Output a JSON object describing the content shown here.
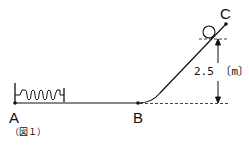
{
  "figure": {
    "caption": "（図１）",
    "points": {
      "A": "A",
      "B": "B",
      "C": "C"
    },
    "height_label": "2.5 〔m〕",
    "colors": {
      "line": "#111111",
      "background": "#ffffff"
    },
    "elements": [
      "wall",
      "spring",
      "track",
      "ball",
      "dashed-reference-lines",
      "height-arrow"
    ]
  }
}
